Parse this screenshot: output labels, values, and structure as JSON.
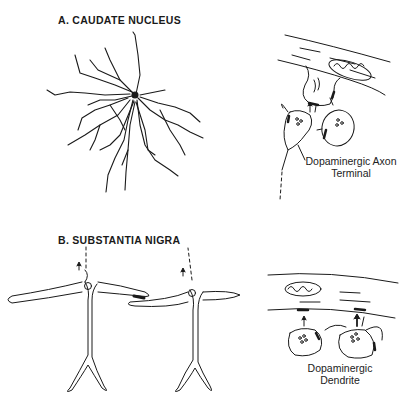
{
  "figure": {
    "panel_a": {
      "title": "A. CAUDATE NUCLEUS",
      "caption_line1": "Dopaminergic Axon",
      "caption_line2": "Terminal"
    },
    "panel_b": {
      "title": "B. SUBSTANTIA NIGRA",
      "caption_line1": "Dopaminergic",
      "caption_line2": "Dendrite"
    },
    "colors": {
      "line": "#1a1a1a",
      "background": "#ffffff"
    }
  }
}
